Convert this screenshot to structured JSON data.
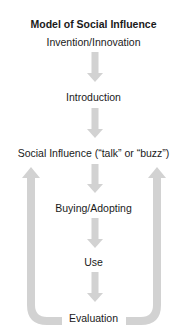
{
  "diagram": {
    "title": "Model of Social Influence",
    "steps": [
      "Invention/Innovation",
      "Introduction",
      "Social Influence (“talk” or “buzz”)",
      "Buying/Adopting",
      "Use",
      "Evaluation"
    ],
    "arrow_color": "#d2d2d2",
    "feedback_loops": [
      {
        "from": "Evaluation",
        "to": "Social Influence (“talk” or “buzz”)",
        "side": "left"
      },
      {
        "from": "Evaluation",
        "to": "Social Influence (“talk” or “buzz”)",
        "side": "right"
      }
    ]
  }
}
